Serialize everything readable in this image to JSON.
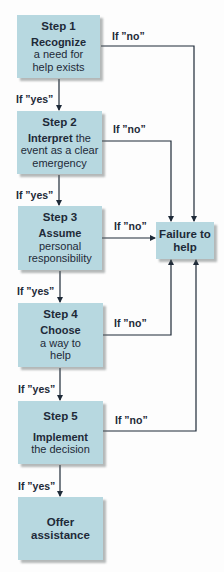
{
  "diagram": {
    "type": "flowchart",
    "steps": [
      {
        "id": "step1",
        "number": "Step 1",
        "bold": "Recognize",
        "rest_lines": [
          "a need for",
          "help exists"
        ],
        "bold_suffix": ""
      },
      {
        "id": "step2",
        "number": "Step 2",
        "bold": "Interpret",
        "bold_suffix": " the",
        "rest_lines": [
          "event as a clear",
          "emergency"
        ]
      },
      {
        "id": "step3",
        "number": "Step 3",
        "bold": "Assume",
        "bold_suffix": "",
        "rest_lines": [
          "personal",
          "responsibility"
        ]
      },
      {
        "id": "step4",
        "number": "Step 4",
        "bold": "Choose",
        "bold_suffix": "",
        "rest_lines": [
          "a way to",
          "help"
        ]
      },
      {
        "id": "step5",
        "number": "Step 5",
        "bold": "Implement",
        "bold_suffix": "",
        "rest_lines": [
          "the decision"
        ]
      }
    ],
    "outcome_success": {
      "line1": "Offer",
      "line2": "assistance"
    },
    "outcome_failure": {
      "line1": "Failure to",
      "line2": "help"
    },
    "labels": {
      "yes": "If ”yes”",
      "no": "If ”no”"
    },
    "edges": [
      {
        "from": "step1",
        "to": "step2",
        "label": "If ”yes”"
      },
      {
        "from": "step2",
        "to": "step3",
        "label": "If ”yes”"
      },
      {
        "from": "step3",
        "to": "step4",
        "label": "If ”yes”"
      },
      {
        "from": "step4",
        "to": "step5",
        "label": "If ”yes”"
      },
      {
        "from": "step5",
        "to": "offer-assistance",
        "label": "If ”yes”"
      },
      {
        "from": "step1",
        "to": "failure-to-help",
        "label": "If ”no”"
      },
      {
        "from": "step2",
        "to": "failure-to-help",
        "label": "If ”no”"
      },
      {
        "from": "step3",
        "to": "failure-to-help",
        "label": "If ”no”"
      },
      {
        "from": "step4",
        "to": "failure-to-help",
        "label": "If ”no”"
      },
      {
        "from": "step5",
        "to": "failure-to-help",
        "label": "If ”no”"
      }
    ],
    "colors": {
      "box_fill": "#b7d8e0",
      "text": "#1e2a38",
      "line": "#1e2a38",
      "background": "#fdfdfd"
    }
  }
}
